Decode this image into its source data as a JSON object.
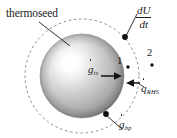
{
  "figure": {
    "type": "thermal-energy-balance-diagram",
    "background_color": "#ffffff",
    "width": 177,
    "height": 138,
    "annotations": {
      "thermoseed": "thermoseed",
      "dudt_numerator": "dU",
      "dudt_denominator": "dt",
      "g_ts_base": "g",
      "g_ts_subscript": "ts",
      "g_bp_base": "g",
      "g_bp_subscript": "bp",
      "q_rhs_base": "q",
      "q_rhs_subscript": "RHS",
      "point_1": "1",
      "point_2": "2"
    },
    "colors": {
      "ink": "#1a1a1a",
      "dashed_boundary": "#8c8c8c",
      "sphere_highlight": "#ffffff",
      "sphere_mid": "#c9c9c9",
      "sphere_edge": "#8f8f8f",
      "sphere_shadow": "#7a7a7a"
    },
    "geometry": {
      "sphere_center_x": 82,
      "sphere_center_y": 76,
      "sphere_radius": 42,
      "boundary_radius": 57,
      "highlight_x": 68,
      "highlight_y": 58
    }
  }
}
